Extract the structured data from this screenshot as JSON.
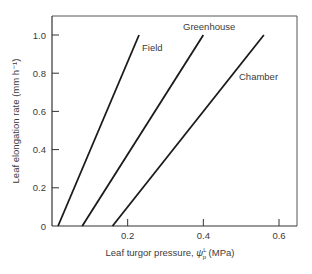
{
  "chart_data": {
    "type": "line",
    "title": "",
    "xlabel": "Leaf turgor pressure, ψp L (MPa)",
    "xlabel_parts": {
      "prefix": "Leaf turgor pressure, ",
      "symbol": "ψ",
      "sup": "L",
      "sub": "p",
      "suffix": " (MPa)"
    },
    "ylabel": "Leaf elongation rate (mm h⁻¹)",
    "xlim": [
      0,
      0.65
    ],
    "ylim": [
      0,
      1.1
    ],
    "xticks": [
      0.2,
      0.4,
      0.6
    ],
    "xtick_labels": [
      "0.2",
      "0.4",
      "0.6"
    ],
    "yticks": [
      0,
      0.2,
      0.4,
      0.6,
      0.8,
      1.0
    ],
    "ytick_labels": [
      "0",
      "0.2",
      "0.4",
      "0.6",
      "0.8",
      "1.0"
    ],
    "grid": false,
    "legend": "inline labels",
    "series": [
      {
        "name": "Field",
        "x": [
          0.016,
          0.23
        ],
        "y": [
          0,
          1.0
        ]
      },
      {
        "name": "Greenhouse",
        "x": [
          0.08,
          0.4
        ],
        "y": [
          0,
          1.0
        ]
      },
      {
        "name": "Chamber",
        "x": [
          0.16,
          0.56
        ],
        "y": [
          0,
          1.0
        ]
      }
    ]
  }
}
